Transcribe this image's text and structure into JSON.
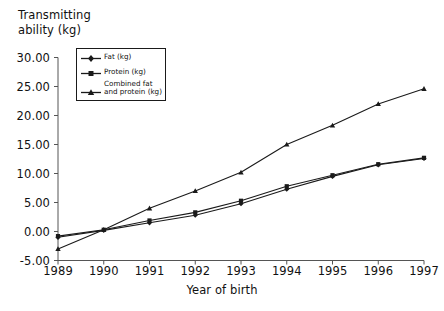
{
  "chart_data": {
    "type": "line",
    "title": "",
    "xlabel": "Year of birth",
    "ylabel": "Transmitting ability (kg)",
    "x": [
      1989,
      1990,
      1991,
      1992,
      1993,
      1994,
      1995,
      1996,
      1997
    ],
    "xticklabels": [
      "1989",
      "1990",
      "1991",
      "1992",
      "1993",
      "1994",
      "1995",
      "1996",
      "1997"
    ],
    "yticklabels": [
      "-5.00",
      "0.00",
      "5.00",
      "10.00",
      "15.00",
      "20.00",
      "25.00",
      "30.00"
    ],
    "yticks": [
      -5,
      0,
      5,
      10,
      15,
      20,
      25,
      30
    ],
    "ylim": [
      -5,
      30
    ],
    "xlim": [
      1989,
      1997
    ],
    "grid": false,
    "legend_position": "upper-left-inside",
    "series": [
      {
        "name": "Fat (kg)",
        "label": "Fat (kg)",
        "color": "#1a1a1a",
        "marker": "diamond",
        "values": [
          -1.0,
          0.2,
          1.5,
          2.8,
          4.8,
          7.3,
          9.5,
          11.5,
          12.6
        ]
      },
      {
        "name": "Protein (kg)",
        "label": "Protein (kg)",
        "color": "#1a1a1a",
        "marker": "square",
        "values": [
          -0.8,
          0.3,
          1.9,
          3.3,
          5.3,
          7.8,
          9.7,
          11.6,
          12.7
        ]
      },
      {
        "name": "Combined fat and protein (kg)",
        "label": "Combined fat\nand protein (kg)",
        "color": "#1a1a1a",
        "marker": "triangle",
        "values": [
          -3.0,
          0.3,
          4.0,
          7.0,
          10.2,
          15.0,
          18.3,
          22.0,
          24.6
        ]
      }
    ]
  },
  "axes": {
    "y_title": "Transmitting\nability (kg)",
    "x_title": "Year of birth"
  },
  "colors": {
    "line": "#1a1a1a",
    "axis": "#555555",
    "background": "#ffffff"
  }
}
